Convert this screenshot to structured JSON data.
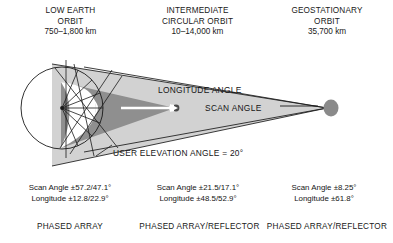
{
  "figure": {
    "title_columns": [
      {
        "id": "leo",
        "line1": "LOW EARTH",
        "line2": "ORBIT",
        "altitude": "750–1,800 km",
        "antenna": "PHASED ARRAY",
        "scan_angle": "Scan Angle ±57.2/47.1°",
        "longitude": "Longitude ±12.8/22.9°"
      },
      {
        "id": "ico",
        "line1": "INTERMEDIATE",
        "line2": "CIRCULAR ORBIT",
        "altitude": "10–14,000 km",
        "antenna": "PHASED ARRAY/REFLECTOR",
        "scan_angle": "Scan Angle ±21.5/17.1°",
        "longitude": "Longitude ±48.5/52.9°"
      },
      {
        "id": "geo",
        "line1": "GEOSTATIONARY",
        "line2": "ORBIT",
        "altitude": "35,700 km",
        "antenna": "PHASED ARRAY/REFLECTOR",
        "scan_angle": "Scan Angle ±8.25°",
        "longitude": "Longitude ±61.8°"
      }
    ],
    "annotations": {
      "longitude_angle": "LONGITUDE ANGLE",
      "scan_angle": "SCAN ANGLE",
      "user_elevation_angle": "USER ELEVATION ANGLE = 20°"
    },
    "colors": {
      "outer_cone_fill": "#d2d2d2",
      "inner_cone_fill": "#8f8f8f",
      "satellite_fill": "#8a8a8a",
      "line_stroke": "#1a1a1a",
      "earth_fill": "#ffffff",
      "background": "#ffffff"
    }
  }
}
